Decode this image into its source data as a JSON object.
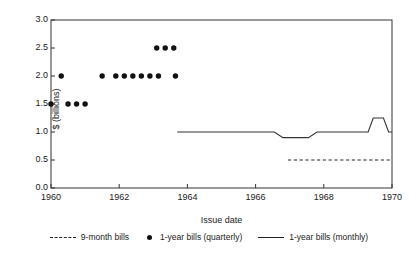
{
  "chart_data": {
    "type": "scatter",
    "title": "",
    "xlabel": "Issue date",
    "ylabel": "$ (billions)",
    "xlim": [
      1960,
      1970
    ],
    "ylim": [
      0.0,
      3.0
    ],
    "grid": false,
    "legend_position": "bottom",
    "xticks": [
      1960,
      1962,
      1964,
      1966,
      1968,
      1970
    ],
    "xtick_labels": [
      "1960",
      "1962",
      "1964",
      "1966",
      "1968",
      "1970"
    ],
    "yticks": [
      0.0,
      0.5,
      1.0,
      1.5,
      2.0,
      2.5,
      3.0
    ],
    "ytick_labels": [
      "0.0",
      "0.5",
      "1.0",
      "1.5",
      "2.0",
      "2.5",
      "3.0"
    ],
    "series": [
      {
        "name": "9-month bills",
        "style": "dashed",
        "type": "line",
        "color": "#222222",
        "x": [
          1966.95,
          1970.0
        ],
        "values": [
          0.5,
          0.5
        ]
      },
      {
        "name": "1-year bills (quarterly)",
        "style": "marker",
        "type": "scatter",
        "color": "#111111",
        "x": [
          1960.0,
          1960.5,
          1960.75,
          1961.0,
          1960.3,
          1961.5,
          1961.9,
          1962.15,
          1962.4,
          1962.65,
          1962.9,
          1963.15,
          1963.1,
          1963.35,
          1963.6,
          1963.65
        ],
        "values": [
          1.5,
          1.5,
          1.5,
          1.5,
          2.0,
          2.0,
          2.0,
          2.0,
          2.0,
          2.0,
          2.0,
          2.0,
          2.5,
          2.5,
          2.5,
          2.0
        ]
      },
      {
        "name": "1-year bills (monthly)",
        "style": "solid",
        "type": "line",
        "color": "#333333",
        "x": [
          1963.7,
          1966.55,
          1966.8,
          1967.55,
          1967.8,
          1969.3,
          1969.45,
          1969.75,
          1969.9,
          1970.0
        ],
        "values": [
          1.0,
          1.0,
          0.9,
          0.9,
          1.0,
          1.0,
          1.25,
          1.25,
          1.0,
          1.0
        ]
      }
    ],
    "points_quarterly": [
      {
        "x": 1960.0,
        "y": 1.5
      },
      {
        "x": 1960.5,
        "y": 1.5
      },
      {
        "x": 1960.75,
        "y": 1.5
      },
      {
        "x": 1961.0,
        "y": 1.5
      },
      {
        "x": 1960.3,
        "y": 2.0
      },
      {
        "x": 1961.5,
        "y": 2.0
      },
      {
        "x": 1961.9,
        "y": 2.0
      },
      {
        "x": 1962.15,
        "y": 2.0
      },
      {
        "x": 1962.4,
        "y": 2.0
      },
      {
        "x": 1962.65,
        "y": 2.0
      },
      {
        "x": 1962.9,
        "y": 2.0
      },
      {
        "x": 1963.65,
        "y": 2.0
      },
      {
        "x": 1963.1,
        "y": 2.5
      },
      {
        "x": 1963.35,
        "y": 2.5
      },
      {
        "x": 1963.6,
        "y": 2.5
      }
    ]
  },
  "legend": {
    "items": [
      {
        "label": "9-month bills",
        "symbol": "dashed-line"
      },
      {
        "label": "1-year bills (quarterly)",
        "symbol": "filled-circle"
      },
      {
        "label": "1-year bills (monthly)",
        "symbol": "solid-line"
      }
    ]
  },
  "colors": {
    "axis": "#333333",
    "marker": "#111111",
    "dashed_series": "#222222",
    "solid_series": "#333333",
    "text": "#1a1a1a",
    "background": "#ffffff"
  }
}
